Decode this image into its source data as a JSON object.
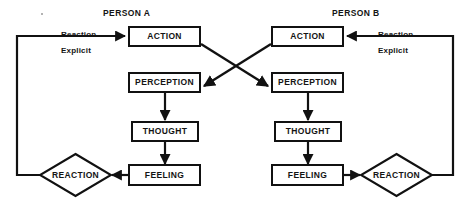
{
  "diagram": {
    "stroke_color": "#111111",
    "background_color": "#ffffff",
    "persons": [
      {
        "id": "person-a",
        "title": "PERSON A",
        "nodes": {
          "action": "ACTION",
          "perception": "PERCEPTION",
          "thought": "THOUGHT",
          "feeling": "FEELING",
          "reaction": "REACTION"
        },
        "inbound_label_line1": "Reaction",
        "inbound_label_line2": "Explicit"
      },
      {
        "id": "person-b",
        "title": "PERSON B",
        "nodes": {
          "action": "ACTION",
          "perception": "PERCEPTION",
          "thought": "THOUGHT",
          "feeling": "FEELING",
          "reaction": "REACTION"
        },
        "inbound_label_line1": "Reaction",
        "inbound_label_line2": "Explicit"
      }
    ],
    "flows": [
      "Person A ACTION crosses to Person B PERCEPTION",
      "Person B ACTION crosses to Person A PERCEPTION",
      "PERCEPTION to THOUGHT to FEELING to REACTION within each person",
      "Person A REACTION returns as Reaction Explicit into Person A ACTION",
      "Person B REACTION returns as Reaction Explicit into Person B ACTION"
    ]
  }
}
